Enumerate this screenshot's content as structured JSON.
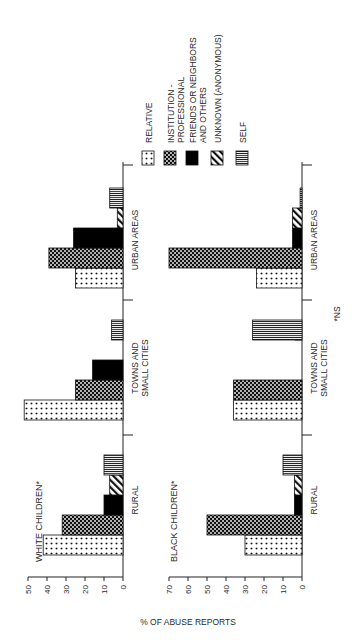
{
  "figure": {
    "y_axis_label": "% OF ABUSE REPORTS",
    "footnote": "*NS",
    "legend": [
      {
        "key": "relative",
        "label_lines": [
          "RELATIVE"
        ],
        "pattern": "dots"
      },
      {
        "key": "institution",
        "label_lines": [
          "INSTITUTION -",
          "PROFESSIONAL"
        ],
        "pattern": "checker"
      },
      {
        "key": "friends",
        "label_lines": [
          "FRIENDS OR NEIGHBORS",
          "AND OTHERS"
        ],
        "pattern": "solid"
      },
      {
        "key": "unknown",
        "label_lines": [
          "UNKNOWN (ANONYMOUS)"
        ],
        "pattern": "hatch"
      },
      {
        "key": "self",
        "label_lines": [
          "SELF"
        ],
        "pattern": "vlines"
      }
    ],
    "panels": [
      {
        "title": "WHITE CHILDREN*"
      },
      {
        "title": "BLACK CHILDREN*"
      }
    ],
    "categories": [
      {
        "lines": [
          "RURAL"
        ]
      },
      {
        "lines": [
          "TOWNS AND",
          "SMALL CITIES"
        ]
      },
      {
        "lines": [
          "URBAN AREAS"
        ]
      }
    ]
  },
  "chart_data": [
    {
      "type": "bar",
      "title": "WHITE CHILDREN*",
      "xlabel": "",
      "ylabel": "% OF ABUSE REPORTS",
      "ylim": [
        0,
        50
      ],
      "yticks": [
        0,
        10,
        20,
        30,
        40,
        50
      ],
      "categories": [
        "RURAL",
        "TOWNS AND SMALL CITIES",
        "URBAN AREAS"
      ],
      "series": [
        {
          "name": "RELATIVE",
          "values": [
            42,
            52,
            25
          ]
        },
        {
          "name": "INSTITUTION - PROFESSIONAL",
          "values": [
            32,
            25,
            39
          ]
        },
        {
          "name": "FRIENDS OR NEIGHBORS AND OTHERS",
          "values": [
            10,
            16,
            26
          ]
        },
        {
          "name": "UNKNOWN (ANONYMOUS)",
          "values": [
            7,
            0,
            3
          ]
        },
        {
          "name": "SELF",
          "values": [
            10,
            6,
            7
          ]
        }
      ],
      "grid": false,
      "legend_position": "right",
      "orientation_note": "figure rotated 90 degrees counter-clockwise on page"
    },
    {
      "type": "bar",
      "title": "BLACK CHILDREN*",
      "xlabel": "",
      "ylabel": "% OF ABUSE REPORTS",
      "ylim": [
        0,
        70
      ],
      "yticks": [
        0,
        10,
        20,
        30,
        40,
        50,
        60,
        70
      ],
      "categories": [
        "RURAL",
        "TOWNS AND SMALL CITIES",
        "URBAN AREAS"
      ],
      "series": [
        {
          "name": "RELATIVE",
          "values": [
            30,
            36,
            24
          ]
        },
        {
          "name": "INSTITUTION - PROFESSIONAL",
          "values": [
            50,
            36,
            70
          ]
        },
        {
          "name": "FRIENDS OR NEIGHBORS AND OTHERS",
          "values": [
            4,
            0,
            5
          ]
        },
        {
          "name": "UNKNOWN (ANONYMOUS)",
          "values": [
            4,
            0,
            5
          ]
        },
        {
          "name": "SELF",
          "values": [
            10,
            26,
            1
          ]
        }
      ],
      "grid": false,
      "annotations": [
        "*NS"
      ]
    }
  ]
}
